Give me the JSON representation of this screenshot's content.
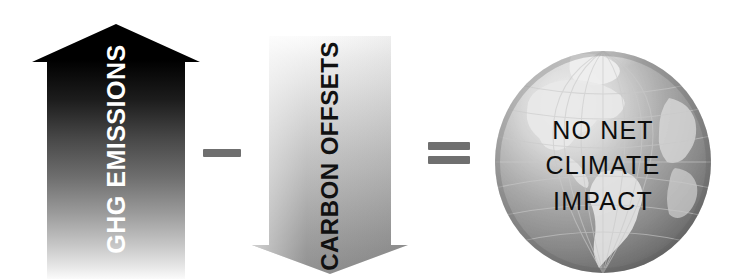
{
  "diagram": {
    "equation_text": "GHG EMISSIONS - CARBON OFFSETS = NO NET CLIMATE IMPACT",
    "background_color": "#ffffff"
  },
  "emissions_arrow": {
    "label": "GHG EMISSIONS",
    "direction": "up",
    "label_color": "#ffffff",
    "gradient_top_color": "#000000",
    "gradient_bottom_color": "#f2f2f2",
    "icon": "arrow-up-icon"
  },
  "minus_operator": {
    "symbol": "-",
    "name": "minus",
    "color": "#6f6f6f"
  },
  "offsets_arrow": {
    "label": "CARBON OFFSETS",
    "direction": "down",
    "label_color": "#111111",
    "gradient_top_color": "#f7f7f7",
    "gradient_bottom_color": "#8a8a8a",
    "icon": "arrow-down-icon"
  },
  "equals_operator": {
    "symbol": "=",
    "name": "equals",
    "color": "#6f6f6f"
  },
  "globe": {
    "icon": "globe-icon",
    "lines": [
      "NO NET",
      "CLIMATE",
      "IMPACT"
    ],
    "line1": "NO NET",
    "line2": "CLIMATE",
    "line3": "IMPACT",
    "text_color": "#0d0d0d",
    "ocean_light_color": "#d8d8d8",
    "ocean_dark_color": "#6d6d6d",
    "land_color": "#efefef",
    "grid_color": "#bfbfbf"
  }
}
